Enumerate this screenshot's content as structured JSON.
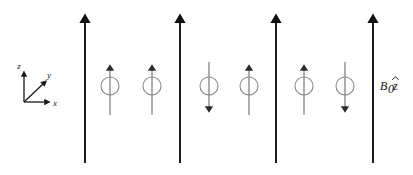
{
  "figure": {
    "background_color": "#ffffff",
    "width": 413,
    "height": 175
  },
  "axes_triad": {
    "name": "coordinate-axes",
    "origin": {
      "x": 24,
      "y": 102
    },
    "z_label": "z",
    "y_label": "y",
    "x_label": "x",
    "color": "#1a1a1a"
  },
  "field": {
    "label_b": "B",
    "label_sub": "0",
    "label_zhat": "z",
    "label_full": "B0ẑ",
    "color": "#111111",
    "line_top_y": 10,
    "line_bottom_y": 163,
    "lines": [
      {
        "name": "field-line-1",
        "x": 85
      },
      {
        "name": "field-line-2",
        "x": 180
      },
      {
        "name": "field-line-3",
        "x": 276
      },
      {
        "name": "field-line-4",
        "x": 373
      }
    ]
  },
  "spins": {
    "color": "#555555",
    "circle_radius": 9,
    "circle_cy": 86,
    "shaft_top_y": 62,
    "shaft_bottom_y": 115,
    "items": [
      {
        "name": "spin-1",
        "x": 110,
        "direction": "up"
      },
      {
        "name": "spin-2",
        "x": 152,
        "direction": "up"
      },
      {
        "name": "spin-3",
        "x": 209,
        "direction": "down"
      },
      {
        "name": "spin-4",
        "x": 249,
        "direction": "up"
      },
      {
        "name": "spin-5",
        "x": 304,
        "direction": "up"
      },
      {
        "name": "spin-6",
        "x": 345,
        "direction": "down"
      }
    ]
  }
}
